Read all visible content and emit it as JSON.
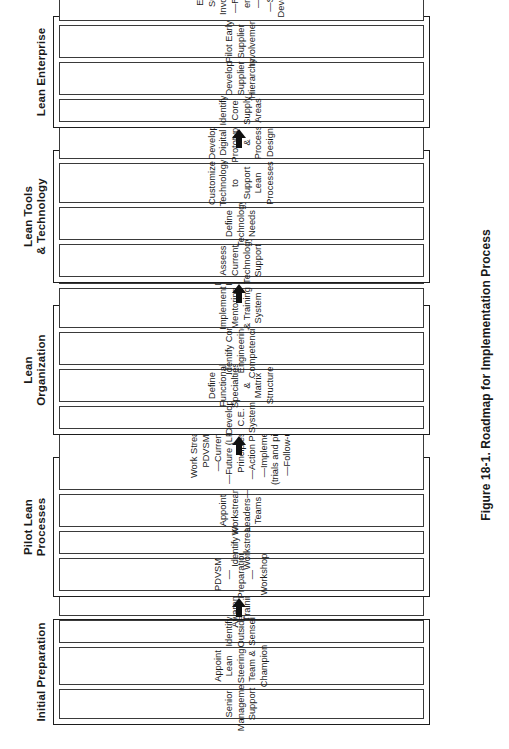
{
  "figure": {
    "caption": "Figure 18-1. Roadmap for Implementation Process",
    "orientation": "rotated-90-ccw",
    "flow_direction": "left-to-right (bottom-to-top as printed)",
    "connector": "solid-black-arrow",
    "colors": {
      "panel_border": "#1d1d1d",
      "box_border": "#3a3a3a",
      "text": "#1a1a1a",
      "background": "#ffffff",
      "arrow": "#111111"
    }
  },
  "stages": [
    {
      "label": "Initial Preparation",
      "boxes": [
        {
          "text": "Senior\nManagement\nSupport"
        },
        {
          "text": "Appoint\nLean Steering\nTeam &\nChampion"
        },
        {
          "text": "Identify Outside\nSensei"
        },
        {
          "text": "Awareness\nTraining"
        },
        {
          "text": "Set up Lean\nProject\nManagement\nObeya"
        }
      ]
    },
    {
      "label": "Pilot Lean\nProcesses",
      "boxes": [
        {
          "text": "PDVSM\n—Preparation\n—Workshop"
        },
        {
          "text": "Identify Key\nWorkstreams"
        },
        {
          "text": "Appoint\nWorkstream\nLeaders—Teams"
        },
        {
          "text": "Work Stream\nPDVSM\n—Current\n—Future (LPDS\nPrinciples)\n—Action Plan\n—Implement\n(trials and pilots)\n—Follow-up"
        },
        {
          "text": "Evaluate &\nModify\nMeasurement\nSystems"
        },
        {
          "text": "Employ\nSupportive Lean\nTools; A3s,\nChecklists, etc."
        }
      ]
    },
    {
      "label": "Lean\nOrganization",
      "boxes": [
        {
          "text": "Develop\nC.E. System"
        },
        {
          "text": "Define Functional\nSpecialties &\nMatrix Structure"
        },
        {
          "text": "Identify Core\nEngineering\nCompetencies"
        },
        {
          "text": "Implement\nMentoring\n& Training\nSystem"
        },
        {
          "text": "Develop &\nImplement\nNew Hire\nSelection Process"
        },
        {
          "text": "Develop Policy\nDeployment\nSystem"
        }
      ]
    },
    {
      "label": "Lean Tools\n& Technology",
      "boxes": [
        {
          "text": "Assess Current\nTechnology\nSupport"
        },
        {
          "text": "Define\nTechnology\nNeeds"
        },
        {
          "text": "Customize\nTechnology to\nSupport Lean\nProcesses"
        },
        {
          "text": "Develop Digital\nPrototype &\nProcess Design"
        },
        {
          "text": "Spread Lean\nSupport Tools\n—A3, Quality\nMatrix\nStandards"
        },
        {
          "text": "Institute PD\nObeya System"
        }
      ]
    },
    {
      "label": "Lean Enterprise",
      "boxes": [
        {
          "text": "Identify Core\nSupply Areas"
        },
        {
          "text": "Develop\nSupplier\nHierarchy"
        },
        {
          "text": "Pilot Early\nSupplier\nInvolvement"
        },
        {
          "text": "Expand Supplier\nInvolvement\n—Resident\nengineer\n—VE VA\n—Supplier\nDevelopment"
        },
        {
          "text": "Develop Flexible\nWork Force"
        }
      ]
    }
  ]
}
